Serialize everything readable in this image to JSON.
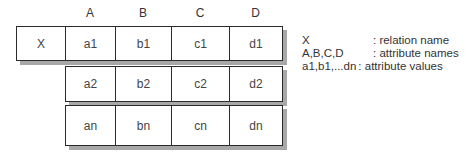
{
  "diagram": {
    "headers": [
      "A",
      "B",
      "C",
      "D"
    ],
    "relation_name": "X",
    "rows": [
      [
        "a1",
        "b1",
        "c1",
        "d1"
      ],
      [
        "a2",
        "b2",
        "c2",
        "d2"
      ],
      [
        "an",
        "bn",
        "cn",
        "dn"
      ]
    ],
    "legend": [
      {
        "key": "X",
        "desc": ": relation name"
      },
      {
        "key": "A,B,C,D",
        "desc": ": attribute names"
      },
      {
        "key": "a1,b1,...dn",
        "desc": ": attribute values"
      }
    ],
    "colors": {
      "border": "#2a2a2a",
      "shadow": "#a8a8a8",
      "text": "#333333"
    }
  }
}
